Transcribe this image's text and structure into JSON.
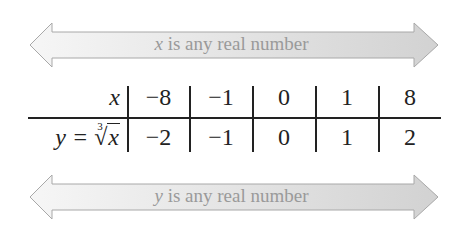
{
  "top_arrow": {
    "var": "x",
    "text": " is any real number"
  },
  "table": {
    "row_x": {
      "label": "x",
      "values": [
        "−8",
        "−1",
        "0",
        "1",
        "8"
      ]
    },
    "row_y": {
      "label_prefix": "y =",
      "radical_index": "3",
      "radical_symbol": "√",
      "radicand": "x",
      "values": [
        "−2",
        "−1",
        "0",
        "1",
        "2"
      ]
    }
  },
  "bottom_arrow": {
    "var": "y",
    "text": " is any real number"
  },
  "colors": {
    "arrow_light": "#f4f4f4",
    "arrow_dark": "#d4d4d4",
    "arrow_stroke": "#a8a8a8",
    "label": "#9a9a9a",
    "ink": "#222222"
  }
}
